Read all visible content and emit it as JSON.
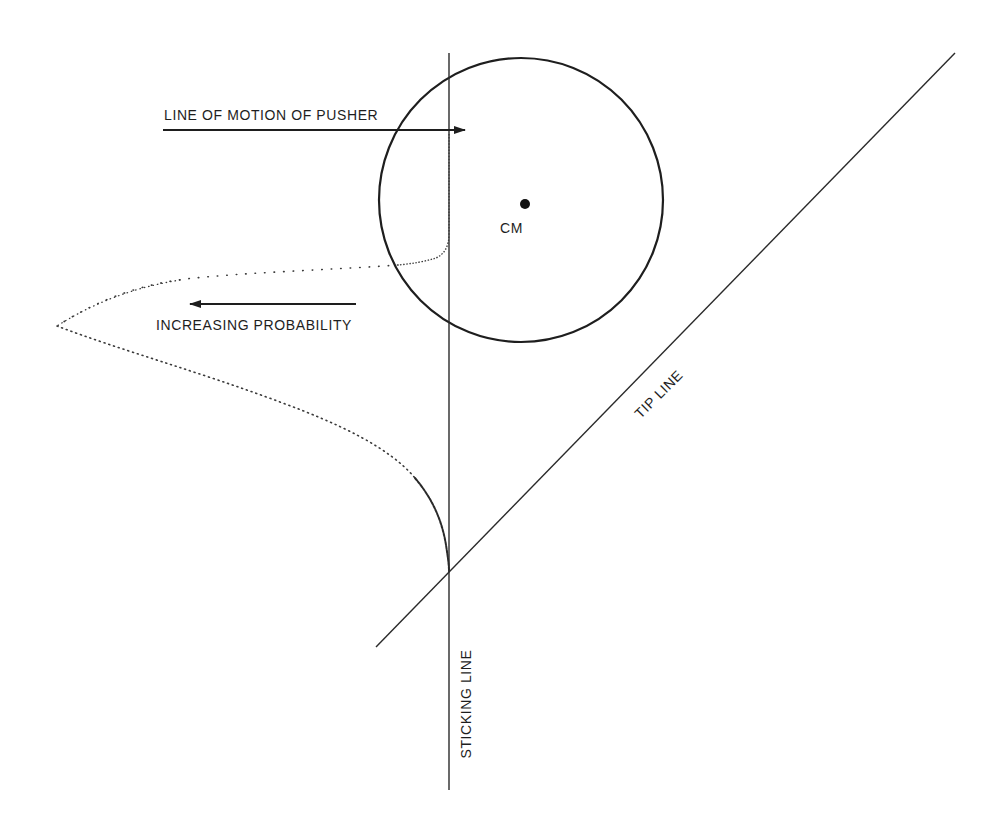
{
  "diagram": {
    "labels": {
      "pusher_motion": "LINE OF MOTION OF PUSHER",
      "increasing_probability": "INCREASING PROBABILITY",
      "center_of_mass": "CM",
      "tip_line": "TIP LINE",
      "sticking_line": "STICKING LINE"
    },
    "colors": {
      "background": "#ffffff",
      "ink": "#1e1e1e",
      "dots": "#3a3a3a"
    },
    "geometry": {
      "disk": {
        "cx": 521,
        "cy": 200,
        "r": 142
      },
      "center_of_mass_dot": {
        "cx": 525,
        "cy": 204,
        "r": 5
      },
      "sticking_line": {
        "x": 449,
        "y1": 53,
        "y2": 790
      },
      "tip_line": {
        "x1": 376,
        "y1": 647,
        "x2": 955,
        "y2": 53
      },
      "pusher_arrow": {
        "x1": 163,
        "y": 130,
        "x2": 465,
        "direction": "right"
      },
      "probability_arrow": {
        "x1": 356,
        "y": 304,
        "x2": 190,
        "direction": "left"
      }
    }
  }
}
